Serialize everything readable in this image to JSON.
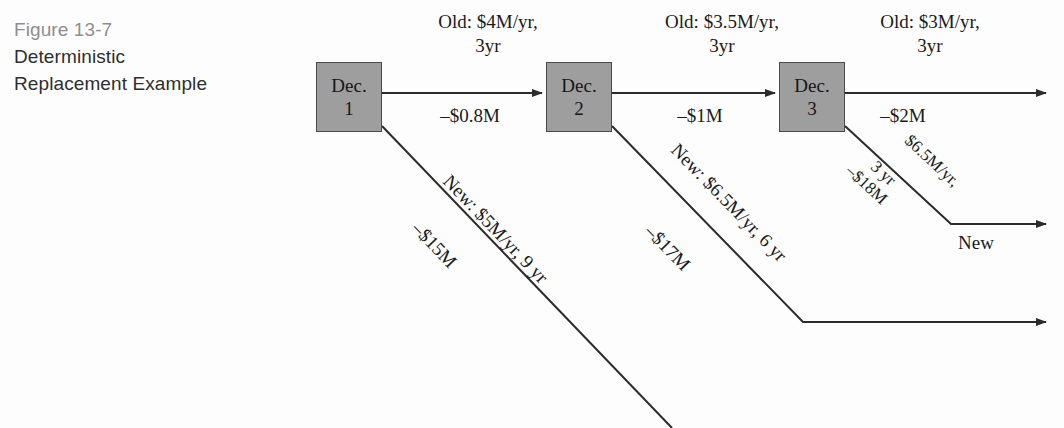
{
  "caption": {
    "figure_number": "Figure 13-7",
    "line1": "Deterministic",
    "line2": "Replacement Example"
  },
  "nodes": [
    {
      "id": "dec1",
      "line1": "Dec.",
      "line2": "1",
      "x": 316,
      "y": 62
    },
    {
      "id": "dec2",
      "line1": "Dec.",
      "line2": "2",
      "x": 546,
      "y": 62
    },
    {
      "id": "dec3",
      "line1": "Dec.",
      "line2": "3",
      "x": 779,
      "y": 62
    }
  ],
  "branches": [
    {
      "id": "dec1-old",
      "kind": "keep-old",
      "above_line1": "Old: $4M/yr,",
      "above_line2": "3yr",
      "below": "–$0.8M"
    },
    {
      "id": "dec2-old",
      "kind": "keep-old",
      "above_line1": "Old: $3.5M/yr,",
      "above_line2": "3yr",
      "below": "–$1M"
    },
    {
      "id": "dec3-old",
      "kind": "keep-old",
      "above_line1": "Old: $3M/yr,",
      "above_line2": "3yr",
      "below": "–$2M"
    },
    {
      "id": "dec1-new",
      "kind": "replace-new",
      "above": "New: $5M/yr, 9 yr",
      "below": "–$15M"
    },
    {
      "id": "dec2-new",
      "kind": "replace-new",
      "above": "New: $6.5M/yr, 6 yr",
      "below": "–$17M"
    },
    {
      "id": "dec3-new",
      "kind": "replace-new",
      "above_line1": "$6.5M/yr,",
      "above_line2": "3 yr",
      "below": "–$18M",
      "terminal_label": "New"
    }
  ],
  "style": {
    "node_fill": "#9e9e9e",
    "node_stroke": "#4a4a4a",
    "edge_color": "#2b2b2b",
    "text_color": "#1a1a1a",
    "caption_color": "#2e2e2e",
    "figure_number_color": "#8e8e8e",
    "background": "#fdfdfd"
  }
}
